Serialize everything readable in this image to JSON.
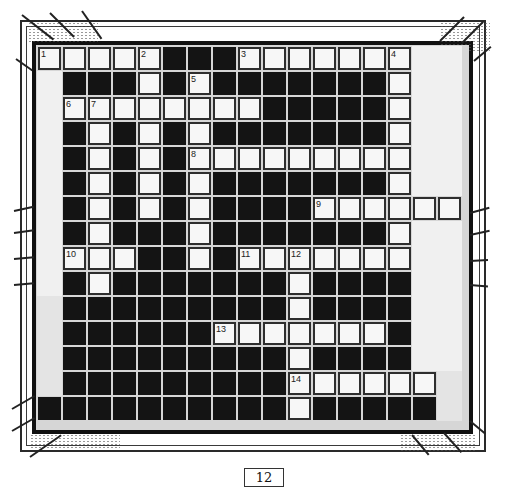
{
  "puzzle": {
    "type": "crossword",
    "columns": 17,
    "rows": 15,
    "legend": {
      "W": "white answer cell",
      "B": "black block",
      "G": "empty margin light",
      "H": "empty margin gray"
    },
    "grid": [
      [
        "W",
        "W",
        "W",
        "W",
        "W",
        "B",
        "B",
        "B",
        "W",
        "W",
        "W",
        "W",
        "W",
        "W",
        "W",
        "G",
        "G"
      ],
      [
        "G",
        "B",
        "B",
        "B",
        "W",
        "B",
        "W",
        "B",
        "B",
        "B",
        "B",
        "B",
        "B",
        "B",
        "W",
        "G",
        "G"
      ],
      [
        "G",
        "W",
        "W",
        "W",
        "W",
        "W",
        "W",
        "W",
        "W",
        "B",
        "B",
        "B",
        "B",
        "B",
        "W",
        "G",
        "G"
      ],
      [
        "G",
        "B",
        "W",
        "B",
        "W",
        "B",
        "W",
        "B",
        "B",
        "B",
        "B",
        "B",
        "B",
        "B",
        "W",
        "G",
        "G"
      ],
      [
        "G",
        "B",
        "W",
        "B",
        "W",
        "B",
        "W",
        "W",
        "W",
        "W",
        "W",
        "W",
        "W",
        "W",
        "W",
        "G",
        "G"
      ],
      [
        "G",
        "B",
        "W",
        "B",
        "W",
        "B",
        "W",
        "B",
        "B",
        "B",
        "B",
        "B",
        "B",
        "B",
        "W",
        "G",
        "G"
      ],
      [
        "G",
        "B",
        "W",
        "B",
        "W",
        "B",
        "W",
        "B",
        "B",
        "B",
        "B",
        "W",
        "W",
        "W",
        "W",
        "W",
        "W"
      ],
      [
        "G",
        "B",
        "W",
        "B",
        "B",
        "B",
        "W",
        "B",
        "B",
        "B",
        "B",
        "B",
        "B",
        "B",
        "W",
        "G",
        "G"
      ],
      [
        "G",
        "W",
        "W",
        "W",
        "B",
        "B",
        "W",
        "B",
        "W",
        "W",
        "W",
        "W",
        "W",
        "W",
        "W",
        "G",
        "G"
      ],
      [
        "G",
        "B",
        "W",
        "B",
        "B",
        "B",
        "B",
        "B",
        "B",
        "B",
        "W",
        "B",
        "B",
        "B",
        "B",
        "G",
        "G"
      ],
      [
        "H",
        "B",
        "B",
        "B",
        "B",
        "B",
        "B",
        "B",
        "B",
        "B",
        "W",
        "B",
        "B",
        "B",
        "B",
        "G",
        "G"
      ],
      [
        "H",
        "B",
        "B",
        "B",
        "B",
        "B",
        "B",
        "W",
        "W",
        "W",
        "W",
        "W",
        "W",
        "W",
        "B",
        "G",
        "G"
      ],
      [
        "H",
        "B",
        "B",
        "B",
        "B",
        "B",
        "B",
        "B",
        "B",
        "B",
        "W",
        "B",
        "B",
        "B",
        "B",
        "G",
        "G"
      ],
      [
        "H",
        "B",
        "B",
        "B",
        "B",
        "B",
        "B",
        "B",
        "B",
        "B",
        "W",
        "W",
        "W",
        "W",
        "W",
        "W",
        "H"
      ],
      [
        "B",
        "B",
        "B",
        "B",
        "B",
        "B",
        "B",
        "B",
        "B",
        "B",
        "W",
        "B",
        "B",
        "B",
        "B",
        "B",
        "H"
      ]
    ],
    "numbers": [
      {
        "n": "1",
        "row": 0,
        "col": 0
      },
      {
        "n": "2",
        "row": 0,
        "col": 4
      },
      {
        "n": "3",
        "row": 0,
        "col": 8
      },
      {
        "n": "4",
        "row": 0,
        "col": 14
      },
      {
        "n": "5",
        "row": 1,
        "col": 6
      },
      {
        "n": "6",
        "row": 2,
        "col": 1
      },
      {
        "n": "7",
        "row": 2,
        "col": 2
      },
      {
        "n": "8",
        "row": 4,
        "col": 6
      },
      {
        "n": "9",
        "row": 6,
        "col": 11
      },
      {
        "n": "10",
        "row": 8,
        "col": 1
      },
      {
        "n": "11",
        "row": 8,
        "col": 8
      },
      {
        "n": "12",
        "row": 8,
        "col": 10
      },
      {
        "n": "13",
        "row": 11,
        "col": 7
      },
      {
        "n": "14",
        "row": 13,
        "col": 10
      }
    ],
    "entries": {
      "across": [
        {
          "n": "1",
          "length": 5
        },
        {
          "n": "3",
          "length": 7
        },
        {
          "n": "6",
          "length": 8
        },
        {
          "n": "8",
          "length": 9
        },
        {
          "n": "9",
          "length": 6
        },
        {
          "n": "10",
          "length": 3
        },
        {
          "n": "11",
          "length": 7
        },
        {
          "n": "13",
          "length": 7
        },
        {
          "n": "14",
          "length": 6
        }
      ],
      "down": [
        {
          "n": "2",
          "length": 7
        },
        {
          "n": "4",
          "length": 9
        },
        {
          "n": "5",
          "length": 8
        },
        {
          "n": "7",
          "length": 8
        },
        {
          "n": "12",
          "length": 7
        }
      ]
    }
  },
  "page": {
    "number": "12"
  },
  "colors": {
    "white_cell": "#f7f7f7",
    "black_cell": "#141414",
    "grid_line": "#d6d6d6",
    "margin_light": "#f0f0f0",
    "margin_gray": "#e4e4e4"
  }
}
